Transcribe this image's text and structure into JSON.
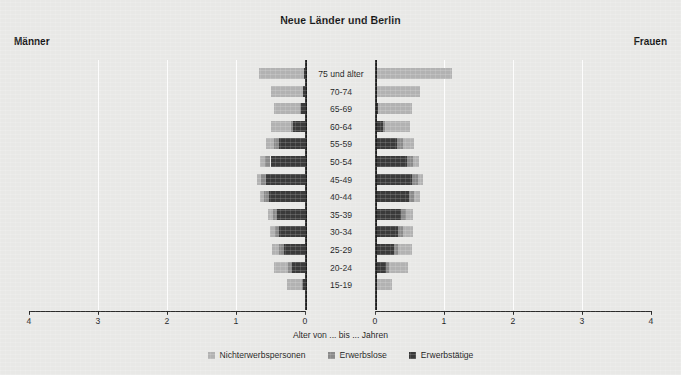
{
  "chart_data": {
    "type": "bar",
    "subtype": "population-pyramid-stacked",
    "title": "Neue Länder und Berlin",
    "left_label": "Männer",
    "right_label": "Frauen",
    "xlabel": "Alter von ... bis ... Jahren",
    "ylabel": "",
    "xlim": [
      0,
      4
    ],
    "xticks": [
      4,
      3,
      2,
      1,
      0
    ],
    "xticks_right": [
      0,
      1,
      2,
      3,
      4
    ],
    "unit": "Millionen",
    "grid": true,
    "legend_position": "bottom",
    "categories": [
      "75 und älter",
      "70-74",
      "65-69",
      "60-64",
      "55-59",
      "50-54",
      "45-49",
      "40-44",
      "35-39",
      "30-34",
      "25-29",
      "20-24",
      "15-19"
    ],
    "series": [
      {
        "name": "Erwerbstätige",
        "color": "#3a3a3a",
        "order": 1,
        "men": [
          0.01,
          0.03,
          0.06,
          0.17,
          0.38,
          0.5,
          0.56,
          0.52,
          0.41,
          0.38,
          0.31,
          0.19,
          0.03
        ],
        "women": [
          0.01,
          0.02,
          0.04,
          0.11,
          0.32,
          0.46,
          0.53,
          0.49,
          0.38,
          0.34,
          0.27,
          0.16,
          0.02
        ]
      },
      {
        "name": "Erwerbslose",
        "color": "#8a8a8a",
        "order": 2,
        "men": [
          0.0,
          0.0,
          0.01,
          0.04,
          0.07,
          0.08,
          0.08,
          0.07,
          0.06,
          0.06,
          0.06,
          0.05,
          0.01
        ],
        "women": [
          0.0,
          0.0,
          0.01,
          0.04,
          0.08,
          0.09,
          0.09,
          0.08,
          0.07,
          0.07,
          0.07,
          0.05,
          0.01
        ]
      },
      {
        "name": "Nichterwerbspersonen",
        "color": "#b2b2b2",
        "order": 3,
        "men": [
          0.66,
          0.46,
          0.38,
          0.29,
          0.12,
          0.07,
          0.05,
          0.06,
          0.06,
          0.07,
          0.11,
          0.21,
          0.22
        ],
        "women": [
          1.11,
          0.63,
          0.49,
          0.36,
          0.16,
          0.09,
          0.08,
          0.08,
          0.1,
          0.14,
          0.2,
          0.27,
          0.22
        ]
      }
    ],
    "totals": {
      "men": [
        0.67,
        0.49,
        0.45,
        0.5,
        0.57,
        0.65,
        0.69,
        0.65,
        0.53,
        0.51,
        0.48,
        0.45,
        0.26
      ],
      "women": [
        1.12,
        0.65,
        0.54,
        0.51,
        0.56,
        0.64,
        0.7,
        0.65,
        0.55,
        0.55,
        0.54,
        0.48,
        0.25
      ]
    },
    "legend": [
      {
        "label": "Nichterwerbspersonen",
        "color": "#b2b2b2"
      },
      {
        "label": "Erwerbslose",
        "color": "#8a8a8a"
      },
      {
        "label": "Erwerbstätige",
        "color": "#3a3a3a"
      }
    ]
  }
}
